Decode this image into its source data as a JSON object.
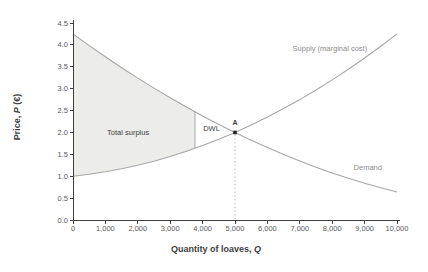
{
  "figure": {
    "background": "#ffffff",
    "axis_color": "#404040",
    "tick_label_color": "#595959",
    "curve_color": "#a6a6a6",
    "surplus_fill_color": "#ececea",
    "annotation_color": "#404040",
    "curve_label_color": "#8c8c8c",
    "point_color": "#262626",
    "dropline_color": "#b5b5b5"
  },
  "chart_data": {
    "type": "line",
    "title": "",
    "xlabel_parts": [
      "Quantity of loaves, ",
      "Q"
    ],
    "ylabel_parts": [
      "Price, ",
      "P",
      " (€)"
    ],
    "xlim": [
      0,
      10000
    ],
    "ylim": [
      0,
      4.5
    ],
    "grid": false,
    "x_ticks": {
      "values": [
        0,
        1000,
        2000,
        3000,
        4000,
        5000,
        6000,
        7000,
        8000,
        9000,
        10000
      ],
      "labels": [
        "0",
        "1,000",
        "2,000",
        "3,000",
        "4,000",
        "5,000",
        "6,000",
        "7,000",
        "8,000",
        "9,000",
        "10,000"
      ]
    },
    "y_ticks": {
      "values": [
        0,
        0.5,
        1.0,
        1.5,
        2.0,
        2.5,
        3.0,
        3.5,
        4.0,
        4.5
      ],
      "labels": [
        "0.0",
        "0.5",
        "1.0",
        "1.5",
        "2.0",
        "2.5",
        "3.0",
        "3.5",
        "4.0",
        "4.5"
      ]
    },
    "series": [
      {
        "name": "Supply (marginal cost)",
        "points": [
          [
            0,
            1.0
          ],
          [
            500,
            1.044
          ],
          [
            1000,
            1.1
          ],
          [
            1500,
            1.169
          ],
          [
            2000,
            1.25
          ],
          [
            2500,
            1.344
          ],
          [
            3000,
            1.45
          ],
          [
            3500,
            1.569
          ],
          [
            4000,
            1.7
          ],
          [
            4500,
            1.844
          ],
          [
            5000,
            2.0
          ],
          [
            5500,
            2.169
          ],
          [
            6000,
            2.35
          ],
          [
            6500,
            2.544
          ],
          [
            7000,
            2.75
          ],
          [
            7500,
            2.969
          ],
          [
            8000,
            3.2
          ],
          [
            8500,
            3.444
          ],
          [
            9000,
            3.7
          ],
          [
            9500,
            3.969
          ],
          [
            10000,
            4.25
          ]
        ]
      },
      {
        "name": "Demand",
        "points": [
          [
            0,
            4.25
          ],
          [
            500,
            3.984
          ],
          [
            1000,
            3.728
          ],
          [
            1500,
            3.48
          ],
          [
            2000,
            3.242
          ],
          [
            2500,
            3.012
          ],
          [
            3000,
            2.791
          ],
          [
            3500,
            2.579
          ],
          [
            4000,
            2.376
          ],
          [
            4500,
            2.182
          ],
          [
            5000,
            2.0
          ],
          [
            5500,
            1.821
          ],
          [
            6000,
            1.654
          ],
          [
            6500,
            1.496
          ],
          [
            7000,
            1.347
          ],
          [
            7500,
            1.207
          ],
          [
            8000,
            1.076
          ],
          [
            8500,
            0.953
          ],
          [
            9000,
            0.84
          ],
          [
            9500,
            0.736
          ],
          [
            10000,
            0.64
          ]
        ]
      }
    ],
    "equilibrium": {
      "q": 5000,
      "p": 2.0
    },
    "surplus_region": {
      "q_end": 3765
    },
    "annotations": {
      "total_surplus": {
        "label": "Total surplus",
        "q": 1700,
        "p": 2.01
      },
      "dwl": {
        "label": "DWL",
        "q": 4275,
        "p": 2.11
      },
      "point": {
        "label": "A",
        "q": 5000,
        "p": 2.25
      },
      "supply": {
        "label": "Supply (marginal cost)",
        "q": 7930,
        "p": 3.92
      },
      "demand": {
        "label": "Demand",
        "q": 9100,
        "p": 1.22
      }
    }
  }
}
